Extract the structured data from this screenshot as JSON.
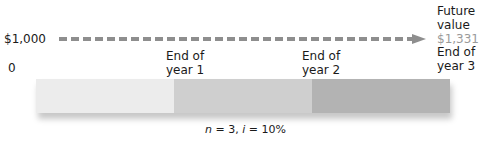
{
  "diagram": {
    "start_value": "$1,000",
    "start_period": "0",
    "future_value_label_line1": "Future",
    "future_value_label_line2": "value",
    "future_value": "$1,331",
    "ticks": [
      {
        "line1": "End of",
        "line2": "year 1"
      },
      {
        "line1": "End of",
        "line2": "year 2"
      },
      {
        "line1": "End of",
        "line2": "year 3"
      }
    ],
    "segments": [
      {
        "period": 1,
        "color": "#ececec"
      },
      {
        "period": 2,
        "color": "#cfcfcf"
      },
      {
        "period": 3,
        "color": "#b3b3b3"
      }
    ],
    "arrow_color": "#8e8e8e",
    "caption": {
      "n_var": "n",
      "n_text": " = 3, ",
      "i_var": "i",
      "i_text": " = 10%"
    }
  }
}
